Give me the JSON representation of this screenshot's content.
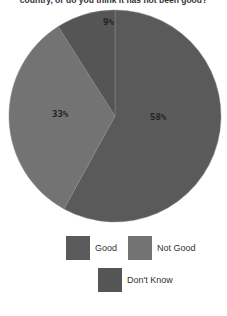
{
  "chart_data": {
    "type": "pie",
    "title": "country, or do you think it has not been good?",
    "categories": [
      "Good",
      "Not Good",
      "Don't Know"
    ],
    "values": [
      58,
      33,
      9
    ],
    "labels": [
      "58%",
      "33%",
      "9%"
    ],
    "colors": [
      "#5a5a5a",
      "#737373",
      "#555555"
    ],
    "start_angle": "12 o'clock, clockwise",
    "legend_position": "bottom"
  },
  "legend": {
    "items": [
      {
        "label": "Good",
        "color": "#5a5a5a"
      },
      {
        "label": "Not Good",
        "color": "#737373"
      },
      {
        "label": "Don't Know",
        "color": "#555555"
      }
    ]
  }
}
